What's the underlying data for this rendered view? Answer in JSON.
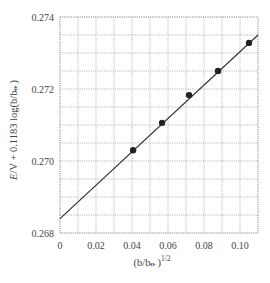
{
  "chart_data": {
    "type": "scatter",
    "title": "",
    "xlabel": "(b/b⦵)^1/2",
    "ylabel": "E/V + 0.1183 log(b/b⦵)",
    "xlim": [
      0,
      0.11
    ],
    "ylim": [
      0.268,
      0.274
    ],
    "grid": true,
    "grid_x_step": 0.01,
    "grid_y_step": 0.0005,
    "x_ticks": [
      0,
      0.02,
      0.04,
      0.06,
      0.08,
      0.1
    ],
    "x_tick_labels": [
      "0",
      "0.02",
      "0.04",
      "0.06",
      "0.08",
      "0.10"
    ],
    "y_ticks": [
      0.268,
      0.27,
      0.272,
      0.274
    ],
    "y_tick_labels": [
      "0.268",
      "0.270",
      "0.272",
      "0.274"
    ],
    "series": [
      {
        "name": "data",
        "type": "scatter",
        "x": [
          0.0406,
          0.0567,
          0.0717,
          0.0878,
          0.105
        ],
        "y": [
          0.2703,
          0.27106,
          0.27183,
          0.2725,
          0.27328
        ]
      },
      {
        "name": "linear fit",
        "type": "line",
        "x": [
          0,
          0.11
        ],
        "y": [
          0.2684,
          0.2735
        ]
      }
    ],
    "legend": null
  },
  "labels": {
    "xlabel_main": "(b/b",
    "xlabel_sym": "⦵",
    "xlabel_close": ")",
    "xlabel_exp": "1/2",
    "ylabel_E": "E",
    "ylabel_rest": "/V + 0.1183 log(b/b",
    "ylabel_sym": "⦵",
    "ylabel_close": ")"
  }
}
